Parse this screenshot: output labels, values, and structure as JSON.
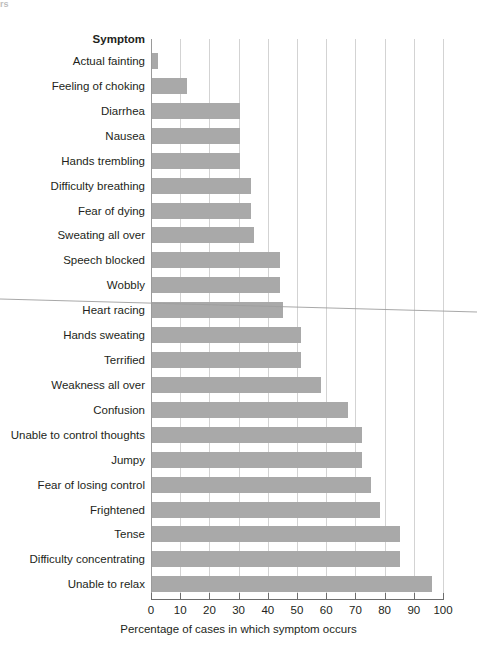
{
  "page": {
    "top_sliver_text": "rs",
    "background_color": "#ffffff",
    "bar_color": "#a9a9a9",
    "gridline_color": "#d3d3d3",
    "axis_color": "#6d6d6d",
    "text_color": "#231f20"
  },
  "chart_data": {
    "type": "bar",
    "orientation": "horizontal",
    "title": "",
    "category_header": "Symptom",
    "xlabel": "Percentage of cases in which symptom occurs",
    "ylabel": "Symptom",
    "xlim": [
      0,
      100
    ],
    "xticks": [
      0,
      10,
      20,
      30,
      40,
      50,
      60,
      70,
      80,
      90,
      100
    ],
    "xticklabels": [
      "0",
      "10",
      "20",
      "30",
      "40",
      "50",
      "60",
      "70",
      "80",
      "90",
      "100"
    ],
    "grid": "vertical-major",
    "legend": "none",
    "categories": [
      "Actual fainting",
      "Feeling of choking",
      "Diarrhea",
      "Nausea",
      "Hands trembling",
      "Difficulty breathing",
      "Fear of dying",
      "Sweating all over",
      "Speech blocked",
      "Wobbly",
      "Heart racing",
      "Hands sweating",
      "Terrified",
      "Weakness all over",
      "Confusion",
      "Unable to control thoughts",
      "Jumpy",
      "Fear of losing control",
      "Frightened",
      "Tense",
      "Difficulty concentrating",
      "Unable to relax"
    ],
    "values": [
      2,
      12,
      30,
      30,
      30,
      34,
      34,
      35,
      44,
      44,
      45,
      51,
      51,
      58,
      67,
      72,
      72,
      75,
      78,
      85,
      85,
      96
    ]
  }
}
